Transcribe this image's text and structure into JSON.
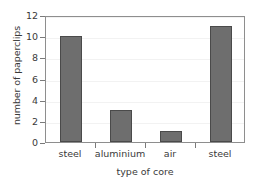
{
  "chart_data": {
    "type": "bar",
    "title": "",
    "subtitle": "",
    "xlabel": "type of core",
    "ylabel": "number of paperclips",
    "categories": [
      "steel",
      "aluminium",
      "air",
      "steel"
    ],
    "values": [
      10,
      3,
      1,
      11
    ],
    "series": [
      {
        "name": "number of paperclips",
        "values": [
          10,
          3,
          1,
          11
        ]
      }
    ],
    "ylim": [
      0,
      12
    ],
    "yticks": [
      0,
      2,
      4,
      6,
      8,
      10,
      12
    ],
    "ytick_labels": [
      "0",
      "2",
      "4",
      "6",
      "8",
      "10",
      "12"
    ],
    "grid": true,
    "grid_axis": "y",
    "legend": false,
    "legend_position": "none",
    "annotations": [],
    "colors": {
      "bar_fill": "#6e6e6e",
      "bar_edge": "#4a4a4a",
      "axis": "#8e8e8e",
      "grid": "#f2f2f2",
      "text": "#3a3a3a",
      "background": "#ffffff"
    }
  }
}
